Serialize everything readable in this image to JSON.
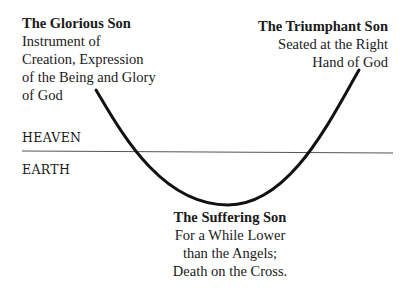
{
  "labels": {
    "glorious": {
      "title": "The Glorious Son",
      "lines": [
        "Instrument of",
        "Creation, Expression",
        "of the Being and Glory",
        "of God"
      ]
    },
    "triumphant": {
      "title": "The Triumphant Son",
      "lines": [
        "Seated at the Right",
        "Hand of God"
      ]
    },
    "suffering": {
      "title": "The Suffering Son",
      "lines": [
        "For a While Lower",
        "than the Angels;",
        "Death on the Cross."
      ]
    }
  },
  "realms": {
    "upper": "HEAVEN",
    "lower": "EARTH"
  },
  "colors": {
    "curve": "#111111",
    "horizon": "#555555",
    "text": "#1a1a1a"
  }
}
